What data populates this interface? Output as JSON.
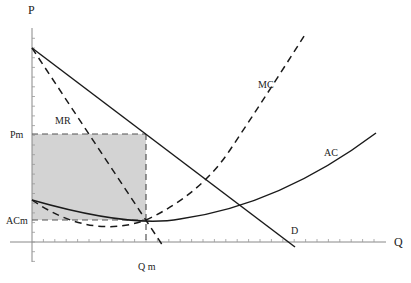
{
  "chart_data": {
    "type": "line",
    "title": "",
    "xlabel": "Q",
    "ylabel": "P",
    "grid": false,
    "legend": null,
    "colors": {
      "curves": "#1a1a1a",
      "shade": "#d3d3d3",
      "axis": "#888888"
    },
    "axes": {
      "x_range": [
        0,
        31
      ],
      "y_range": [
        -2,
        22
      ],
      "x_tick_count": 31,
      "y_tick_count": 22,
      "special_x_ticks": [
        {
          "label": "Qm",
          "value": 10
        }
      ],
      "special_y_ticks": [
        {
          "label": "Pm",
          "value": 11.1
        },
        {
          "label": "ACm",
          "value": 2.3
        }
      ]
    },
    "series": [
      {
        "name": "D",
        "style": "solid",
        "points": [
          [
            0,
            20
          ],
          [
            23.1,
            -0.5
          ]
        ]
      },
      {
        "name": "MR",
        "style": "dashed",
        "points": [
          [
            0,
            20
          ],
          [
            11.5,
            -0.4
          ]
        ]
      },
      {
        "name": "AC",
        "style": "solid",
        "points": [
          [
            0,
            4.3
          ],
          [
            5,
            2.9
          ],
          [
            10,
            2.3
          ],
          [
            15,
            2.6
          ],
          [
            18.3,
            3.8
          ],
          [
            25,
            7.3
          ],
          [
            30.1,
            11.2
          ]
        ]
      },
      {
        "name": "MC",
        "style": "dashed",
        "points": [
          [
            0,
            4.3
          ],
          [
            3,
            2.6
          ],
          [
            6.4,
            1.5
          ],
          [
            10,
            2.3
          ],
          [
            15.3,
            6.4
          ],
          [
            20,
            11.5
          ],
          [
            24.0,
            21.5
          ]
        ]
      }
    ],
    "shaded_region": {
      "label": "profit",
      "x": [
        0,
        10
      ],
      "y": [
        2.3,
        11.1
      ]
    },
    "annotations": [
      {
        "text": "MR",
        "near": "MR curve"
      },
      {
        "text": "MC",
        "near": "MC curve"
      },
      {
        "text": "AC",
        "near": "AC curve"
      },
      {
        "text": "D",
        "near": "demand curve end"
      }
    ]
  },
  "labels": {
    "y_axis": "P",
    "x_axis": "Q",
    "pm": "Pm",
    "acm": "ACm",
    "qm": "Q m",
    "mr": "MR",
    "mc": "MC",
    "ac": "AC",
    "d": "D"
  }
}
